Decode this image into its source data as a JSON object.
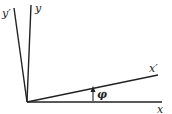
{
  "diagram": {
    "title": "",
    "origin": [
      27,
      102
    ],
    "axes": [
      {
        "id": "x",
        "label": "x",
        "end": [
          162,
          102
        ],
        "label_pos": [
          157,
          113
        ]
      },
      {
        "id": "x_prime",
        "label": "x′",
        "end": [
          158,
          75
        ],
        "label_pos": [
          149,
          72
        ]
      },
      {
        "id": "y",
        "label": "y",
        "end": [
          31,
          5
        ],
        "label_pos": [
          35,
          12
        ]
      },
      {
        "id": "y_prime",
        "label": "y′",
        "end": [
          14,
          8
        ],
        "label_pos": [
          2,
          17
        ]
      }
    ],
    "angle": {
      "label": "φ",
      "arrow_x": 93,
      "arrow_from_y": 101,
      "arrow_to_y": 88,
      "label_pos": [
        97,
        98
      ]
    },
    "stroke_color": "#222222"
  }
}
